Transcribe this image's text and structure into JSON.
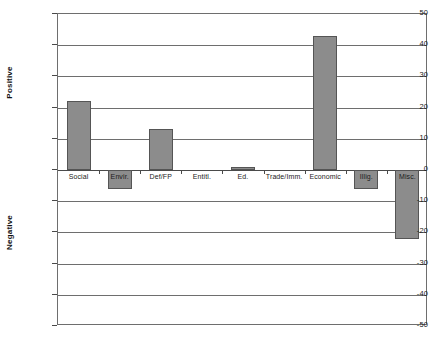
{
  "chart_data": {
    "type": "bar",
    "title": "",
    "subtitle": "",
    "xlabel": "",
    "ylabel": "",
    "ylabel_upper": "Positive",
    "ylabel_lower": "Negative",
    "ylim": [
      -50,
      50
    ],
    "ytick_labels": [
      "50",
      "40",
      "30",
      "20",
      "10",
      "0",
      "-10",
      "-20",
      "-30",
      "-40",
      "-50"
    ],
    "ytick_values": [
      50,
      40,
      30,
      20,
      10,
      0,
      -10,
      -20,
      -30,
      -40,
      -50
    ],
    "grid": true,
    "legend": false,
    "categories": [
      "Social",
      "Envir.",
      "Def/FP",
      "Entitl.",
      "Ed.",
      "Trade/Imm.",
      "Economic",
      "Illig.",
      "Misc."
    ],
    "values": [
      22,
      -6,
      13,
      0,
      1,
      0,
      43,
      -6,
      -22
    ],
    "bar_color": "#8c8c8c",
    "bar_border_color": "#555555",
    "grid_color": "#6e6e6e",
    "axis_color": "#4a4a4a",
    "background": "#ffffff"
  }
}
